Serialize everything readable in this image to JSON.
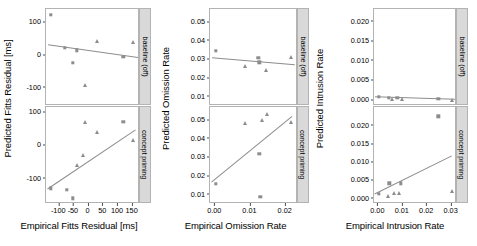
{
  "figure": {
    "type": "scatter-facet-grid",
    "rows": [
      "baseline (off)",
      "concept priming"
    ],
    "marker_color": "#8c8c8c",
    "line_color": "#8c8c8c",
    "panel_border_color": "#b3b3b3",
    "strip_background": "#d9d9d9"
  },
  "chart_data": [
    {
      "type": "scatter",
      "id": "fitts-baseline",
      "title": "",
      "strip_label": "baseline (off)",
      "xlabel": "Empirical Fitts Residual [ms]",
      "ylabel": "Predicted Fitts Residual [ms]",
      "xlim": [
        -145,
        175
      ],
      "ylim": [
        -155,
        140
      ],
      "xticks": [
        -100,
        -50,
        0,
        50,
        100,
        150
      ],
      "xticklabels": [
        "-100",
        "-50",
        "0",
        "50",
        "100",
        "150"
      ],
      "yticks": [
        100,
        0,
        -100
      ],
      "yticklabels": [
        "100",
        "0",
        "-100"
      ],
      "grid": false,
      "legend": "none",
      "series": [
        {
          "name": "square",
          "marker": "square",
          "points": [
            {
              "x": -128,
              "y": 122
            },
            {
              "x": -82,
              "y": 22
            },
            {
              "x": -54,
              "y": -23
            },
            {
              "x": -40,
              "y": 14
            },
            {
              "x": 118,
              "y": -5
            }
          ]
        },
        {
          "name": "triangle",
          "marker": "triangle",
          "points": [
            {
              "x": -12,
              "y": -92
            },
            {
              "x": 30,
              "y": 42
            },
            {
              "x": 152,
              "y": 39
            }
          ]
        }
      ],
      "fit_line": {
        "x1": -138,
        "y1": 31,
        "x2": 170,
        "y2": -8
      }
    },
    {
      "type": "scatter",
      "id": "fitts-priming",
      "title": "",
      "strip_label": "concept priming",
      "xlabel": "Empirical Fitts Residual [ms]",
      "ylabel": "Predicted Fitts Residual [ms]",
      "xlim": [
        -145,
        175
      ],
      "ylim": [
        -175,
        115
      ],
      "xticks": [
        -100,
        -50,
        0,
        50,
        100,
        150
      ],
      "xticklabels": [
        "-100",
        "-50",
        "0",
        "50",
        "100",
        "150"
      ],
      "yticks": [
        100,
        0,
        -100
      ],
      "yticklabels": [
        "100",
        "0",
        "-100"
      ],
      "grid": false,
      "legend": "none",
      "series": [
        {
          "name": "square",
          "marker": "square",
          "points": [
            {
              "x": -128,
              "y": -128
            },
            {
              "x": -74,
              "y": -133
            },
            {
              "x": -54,
              "y": -158
            },
            {
              "x": 118,
              "y": 70
            }
          ]
        },
        {
          "name": "triangle",
          "marker": "triangle",
          "points": [
            {
              "x": -40,
              "y": -58
            },
            {
              "x": -18,
              "y": -28
            },
            {
              "x": -12,
              "y": 69
            },
            {
              "x": 30,
              "y": 41
            },
            {
              "x": 152,
              "y": 15
            }
          ]
        }
      ],
      "fit_line": {
        "x1": -138,
        "y1": -130,
        "x2": 162,
        "y2": 47
      }
    },
    {
      "type": "scatter",
      "id": "omission-baseline",
      "title": "",
      "strip_label": "baseline (off)",
      "xlabel": "Empirical Omission Rate",
      "ylabel": "Predicted Omission Rate",
      "xlim": [
        -0.0015,
        0.0235
      ],
      "ylim": [
        0.005,
        0.057
      ],
      "xticks": [
        0.0,
        0.01,
        0.02
      ],
      "xticklabels": [
        "0.00",
        "0.01",
        "0.02"
      ],
      "yticks": [
        0.05,
        0.04,
        0.03,
        0.02,
        0.01
      ],
      "yticklabels": [
        "0.05",
        "0.04",
        "0.03",
        "0.02",
        "0.01"
      ],
      "grid": false,
      "legend": "none",
      "series": [
        {
          "name": "square",
          "marker": "square",
          "points": [
            {
              "x": 0.0002,
              "y": 0.0345
            },
            {
              "x": 0.0122,
              "y": 0.0308
            },
            {
              "x": 0.0125,
              "y": 0.0284
            }
          ]
        },
        {
          "name": "triangle",
          "marker": "triangle",
          "points": [
            {
              "x": 0.0085,
              "y": 0.0262
            },
            {
              "x": 0.0145,
              "y": 0.0245
            },
            {
              "x": 0.0215,
              "y": 0.0312
            }
          ]
        }
      ],
      "fit_line": {
        "x1": -0.0008,
        "y1": 0.0309,
        "x2": 0.0228,
        "y2": 0.0272
      }
    },
    {
      "type": "scatter",
      "id": "omission-priming",
      "title": "",
      "strip_label": "concept priming",
      "xlabel": "Empirical Omission Rate",
      "ylabel": "Predicted Omission Rate",
      "xlim": [
        -0.0015,
        0.0235
      ],
      "ylim": [
        0.005,
        0.057
      ],
      "xticks": [
        0.0,
        0.01,
        0.02
      ],
      "xticklabels": [
        "0.00",
        "0.01",
        "0.02"
      ],
      "yticks": [
        0.05,
        0.04,
        0.03,
        0.02,
        0.01
      ],
      "yticklabels": [
        "0.05",
        "0.04",
        "0.03",
        "0.02",
        "0.01"
      ],
      "grid": false,
      "legend": "none",
      "series": [
        {
          "name": "square",
          "marker": "square",
          "points": [
            {
              "x": 0.0002,
              "y": 0.0158
            },
            {
              "x": 0.0125,
              "y": 0.0318
            },
            {
              "x": 0.0128,
              "y": 0.0088
            }
          ]
        },
        {
          "name": "triangle",
          "marker": "triangle",
          "points": [
            {
              "x": 0.0085,
              "y": 0.0482
            },
            {
              "x": 0.0132,
              "y": 0.0502
            },
            {
              "x": 0.0148,
              "y": 0.0532
            },
            {
              "x": 0.0215,
              "y": 0.0492
            }
          ]
        }
      ],
      "fit_line": {
        "x1": -0.0008,
        "y1": 0.0168,
        "x2": 0.0222,
        "y2": 0.0522
      }
    },
    {
      "type": "scatter",
      "id": "intrusion-baseline",
      "title": "",
      "strip_label": "baseline (off)",
      "xlabel": "Empirical Intrusion Rate",
      "ylabel": "Predicted Intrusion Rate",
      "xlim": [
        -0.0018,
        0.0322
      ],
      "ylim": [
        -0.0015,
        0.0232
      ],
      "xticks": [
        0.0,
        0.01,
        0.02,
        0.03
      ],
      "xticklabels": [
        "0.00",
        "0.01",
        "0.02",
        "0.03"
      ],
      "yticks": [
        0.02,
        0.015,
        0.01,
        0.005,
        0.0
      ],
      "yticklabels": [
        "0.020",
        "0.015",
        "0.010",
        "0.005",
        "0.000"
      ],
      "grid": false,
      "legend": "none",
      "series": [
        {
          "name": "square",
          "marker": "square",
          "points": [
            {
              "x": 0.0002,
              "y": 0.0009
            },
            {
              "x": 0.0042,
              "y": 0.0006
            },
            {
              "x": 0.0078,
              "y": 0.0006
            },
            {
              "x": 0.0245,
              "y": 0.0004
            }
          ]
        },
        {
          "name": "triangle",
          "marker": "triangle",
          "points": [
            {
              "x": 0.0055,
              "y": 0.0004
            },
            {
              "x": 0.0098,
              "y": 0.0004
            },
            {
              "x": 0.0302,
              "y": 0.0001
            }
          ]
        }
      ],
      "fit_line": {
        "x1": -0.0012,
        "y1": 0.0008,
        "x2": 0.0315,
        "y2": 0.0002
      }
    },
    {
      "type": "scatter",
      "id": "intrusion-priming",
      "title": "",
      "strip_label": "concept priming",
      "xlabel": "Empirical Intrusion Rate",
      "ylabel": "Predicted Intrusion Rate",
      "xlim": [
        -0.0018,
        0.0322
      ],
      "ylim": [
        -0.0015,
        0.0252
      ],
      "xticks": [
        0.0,
        0.01,
        0.02,
        0.03
      ],
      "xticklabels": [
        "0.00",
        "0.01",
        "0.02",
        "0.03"
      ],
      "yticks": [
        0.02,
        0.015,
        0.01,
        0.005,
        0.0
      ],
      "yticklabels": [
        "0.020",
        "0.015",
        "0.010",
        "0.005",
        "0.000"
      ],
      "grid": false,
      "legend": "none",
      "series": [
        {
          "name": "square",
          "marker": "square",
          "points": [
            {
              "x": 0.0002,
              "y": 0.0013
            },
            {
              "x": 0.0045,
              "y": 0.0042
            },
            {
              "x": 0.0092,
              "y": 0.0042
            },
            {
              "x": 0.0245,
              "y": 0.0226
            }
          ]
        },
        {
          "name": "triangle",
          "marker": "triangle",
          "points": [
            {
              "x": 0.0038,
              "y": 0.0008
            },
            {
              "x": 0.0062,
              "y": 0.0014
            },
            {
              "x": 0.0085,
              "y": 0.0014
            },
            {
              "x": 0.0302,
              "y": 0.0021
            }
          ]
        }
      ],
      "fit_line": {
        "x1": -0.0012,
        "y1": 0.0013,
        "x2": 0.0305,
        "y2": 0.0118
      }
    }
  ],
  "columns": [
    {
      "id": "col-fitts",
      "ylabel": "Predicted Fitts Residual [ms]",
      "xlabel": "Empirical Fitts Residual [ms]",
      "panel_ids": [
        "fitts-baseline",
        "fitts-priming"
      ]
    },
    {
      "id": "col-omission",
      "ylabel": "Predicted Omission Rate",
      "xlabel": "Empirical Omission Rate",
      "panel_ids": [
        "omission-baseline",
        "omission-priming"
      ]
    },
    {
      "id": "col-intrusion",
      "ylabel": "Predicted Intrusion Rate",
      "xlabel": "Empirical Intrusion Rate",
      "panel_ids": [
        "intrusion-baseline",
        "intrusion-priming"
      ]
    }
  ]
}
